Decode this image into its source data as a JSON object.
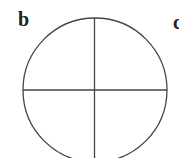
{
  "figure": {
    "panel_labels": [
      "b",
      "c"
    ],
    "diagram": {
      "shape": "circle divided into four quadrants",
      "stroke_color": "#444444",
      "background": "#ffffff"
    }
  }
}
